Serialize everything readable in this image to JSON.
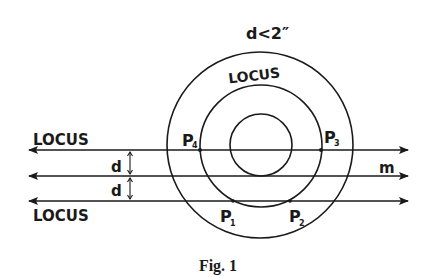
{
  "figure": {
    "caption": "Fig. 1",
    "condition_label": "d<2″",
    "circle_locus_label": "LOCUS",
    "top_line_label": "LOCUS",
    "bottom_line_label": "LOCUS",
    "middle_line_label": "m",
    "distance_label_upper": "d",
    "distance_label_lower": "d",
    "points": [
      {
        "name": "P",
        "sub": "1"
      },
      {
        "name": "P",
        "sub": "2"
      },
      {
        "name": "P",
        "sub": "3"
      },
      {
        "name": "P",
        "sub": "4"
      }
    ],
    "stroke_color": "#1a1a1a"
  }
}
